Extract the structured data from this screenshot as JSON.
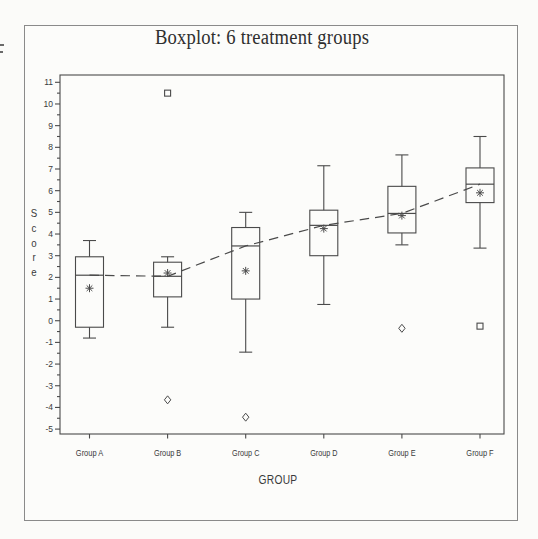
{
  "title": "Boxplot: 6 treatment groups",
  "colors": {
    "background": "#fbfbf9",
    "outer_frame": "#8a8a8a",
    "line": "#4a4a4a",
    "text": "#3a3a3a",
    "box_fill": "#fcfcfa"
  },
  "chart_data": {
    "type": "boxplot",
    "title": "Boxplot: 6 treatment groups",
    "xlabel": "GROUP",
    "ylabel": "Score",
    "ylim": [
      -5,
      11
    ],
    "yticks": [
      -5,
      -4,
      -3,
      -2,
      -1,
      0,
      1,
      2,
      3,
      4,
      5,
      6,
      7,
      8,
      9,
      10,
      11
    ],
    "ytick_major_step": 1,
    "ytick_minor_step": 0.5,
    "grid": false,
    "legend": "none",
    "categories": [
      "Group A",
      "Group B",
      "Group C",
      "Group D",
      "Group E",
      "Group F"
    ],
    "groups": [
      {
        "label": "Group A",
        "min": -0.8,
        "q1": -0.3,
        "median": 2.1,
        "q3": 2.95,
        "max": 3.7,
        "mean": 1.5,
        "outliers": []
      },
      {
        "label": "Group B",
        "min": -0.3,
        "q1": 1.1,
        "median": 2.05,
        "q3": 2.7,
        "max": 2.95,
        "mean": 2.2,
        "outliers": [
          {
            "value": 10.5,
            "marker": "square"
          },
          {
            "value": -3.65,
            "marker": "diamond"
          }
        ]
      },
      {
        "label": "Group C",
        "min": -1.45,
        "q1": 1.0,
        "median": 3.45,
        "q3": 4.3,
        "max": 5.0,
        "mean": 2.3,
        "outliers": [
          {
            "value": -4.45,
            "marker": "diamond"
          }
        ]
      },
      {
        "label": "Group D",
        "min": 0.75,
        "q1": 3.0,
        "median": 4.4,
        "q3": 5.1,
        "max": 7.15,
        "mean": 4.25,
        "outliers": []
      },
      {
        "label": "Group E",
        "min": 3.5,
        "q1": 4.05,
        "median": 4.95,
        "q3": 6.2,
        "max": 7.65,
        "mean": 4.85,
        "outliers": [
          {
            "value": -0.35,
            "marker": "diamond"
          }
        ]
      },
      {
        "label": "Group F",
        "min": 3.35,
        "q1": 5.45,
        "median": 6.3,
        "q3": 7.05,
        "max": 8.5,
        "mean": 5.9,
        "outliers": [
          {
            "value": -0.25,
            "marker": "square"
          }
        ]
      }
    ],
    "mean_marker": "asterisk",
    "connect_line": {
      "style": "dashed",
      "connects": "median"
    }
  }
}
